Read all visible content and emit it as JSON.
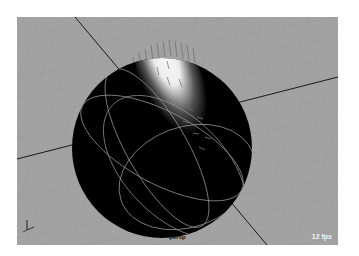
{
  "viewport": {
    "camera": "persp",
    "fps": "12 fps",
    "background": "#a2a2a2"
  },
  "scene": {
    "object": "sphere",
    "shading": "smooth shaded with specular highlight",
    "hair_strands_visible": true,
    "grid_visible": true
  }
}
